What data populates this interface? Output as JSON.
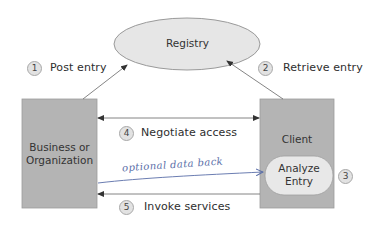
{
  "nodes": {
    "registry": {
      "label": "Registry"
    },
    "business": {
      "label_line1": "Business or",
      "label_line2": "Organization"
    },
    "client": {
      "label": "Client"
    },
    "analyze": {
      "label_line1": "Analyze",
      "label_line2": "Entry"
    }
  },
  "steps": [
    {
      "number": "1",
      "label": "Post entry"
    },
    {
      "number": "2",
      "label": "Retrieve entry"
    },
    {
      "number": "3",
      "label": ""
    },
    {
      "number": "4",
      "label": "Negotiate access"
    },
    {
      "number": "5",
      "label": "Invoke services"
    }
  ],
  "annotation": {
    "handwritten": "optional data back"
  },
  "colors": {
    "box_fill": "#b4b4b4",
    "ellipse_fill": "#e6e6e6",
    "badge_fill": "#e2e2e2",
    "arrow": "#555555",
    "handwriting": "#5a6ea8"
  }
}
